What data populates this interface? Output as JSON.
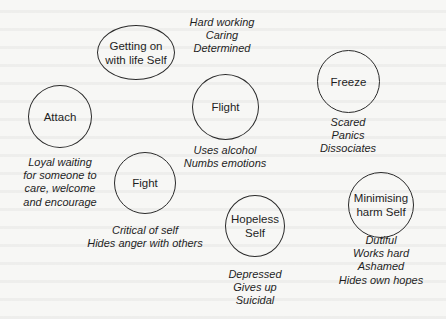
{
  "diagram": {
    "title": "",
    "nodes": [
      {
        "id": "getting-on",
        "label_lines": [
          "Getting on",
          "with life Self"
        ],
        "caption_lines": [
          "Hard working",
          "Caring",
          "Determined"
        ]
      },
      {
        "id": "attach",
        "label_lines": [
          "Attach"
        ],
        "caption_lines": [
          "Loyal waiting",
          "for someone to",
          "care, welcome",
          "and encourage"
        ]
      },
      {
        "id": "flight",
        "label_lines": [
          "Flight"
        ],
        "caption_lines": [
          "Uses alcohol",
          "Numbs emotions"
        ]
      },
      {
        "id": "freeze",
        "label_lines": [
          "Freeze"
        ],
        "caption_lines": [
          "Scared",
          "Panics",
          "Dissociates"
        ]
      },
      {
        "id": "fight",
        "label_lines": [
          "Fight"
        ],
        "caption_lines": [
          "Critical of self",
          "Hides anger with others"
        ]
      },
      {
        "id": "hopeless",
        "label_lines": [
          "Hopeless",
          "Self"
        ],
        "caption_lines": [
          "Depressed",
          "Gives up",
          "Suicidal"
        ]
      },
      {
        "id": "minimising",
        "label_lines": [
          "Minimising",
          "harm Self"
        ],
        "caption_lines": [
          "Dutiful",
          "Works hard",
          "Ashamed",
          "Hides own hopes"
        ]
      }
    ],
    "colors": {
      "stroke": "#2a2a2a",
      "background": "#f7f7f5",
      "text": "#1e1e1e"
    }
  }
}
